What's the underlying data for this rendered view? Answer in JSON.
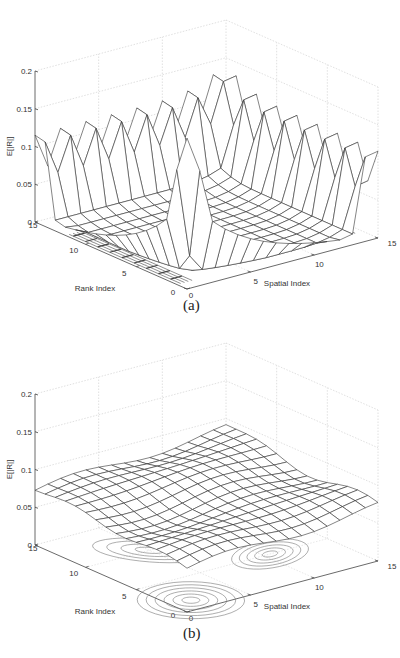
{
  "figure": {
    "panels": [
      {
        "id": "a",
        "caption": "(a)"
      },
      {
        "id": "b",
        "caption": "(b)"
      }
    ]
  },
  "chart_data": [
    {
      "type": "surface3d",
      "title": "",
      "caption": "(a)",
      "xlabel": "Spatial Index",
      "ylabel": "Rank Index",
      "zlabel": "E[|R|]",
      "xticks": [
        "0",
        "5",
        "10",
        "15"
      ],
      "yticks": [
        "0",
        "5",
        "10",
        "15"
      ],
      "zticks": [
        "0",
        "0.05",
        "0.1",
        "0.15",
        "0.2"
      ],
      "xlim": [
        0,
        15
      ],
      "ylim": [
        0,
        15
      ],
      "zlim": [
        0,
        0.2
      ],
      "grid": true,
      "contour_on_floor": true,
      "description": "Surface near 0 in the interior, rising along the outer edges (rank=15 edge and spatial=15 edge) with sawtooth peaks ~0.1; sharp ridge along spatial=0/rank=0 corner with peak ~0.2 near origin",
      "edge_peak_value": 0.1,
      "max_peak_value": 0.2,
      "interior_value": 0.005
    },
    {
      "type": "surface3d",
      "title": "",
      "caption": "(b)",
      "xlabel": "Spatial Index",
      "ylabel": "Rank Index",
      "zlabel": "E[|R|]",
      "xticks": [
        "0",
        "5",
        "10",
        "15"
      ],
      "yticks": [
        "0",
        "5",
        "10",
        "15"
      ],
      "zticks": [
        "0",
        "0.05",
        "0.1",
        "0.15",
        "0.2"
      ],
      "xlim": [
        0,
        15
      ],
      "ylim": [
        0,
        15
      ],
      "zlim": [
        0,
        0.2
      ],
      "grid": true,
      "contour_on_floor": true,
      "description": "Smooth, nearly flat surface around 0.06-0.09, gently higher toward the back corner (~0.09) and lower toward the front (~0.055)",
      "min_value": 0.05,
      "max_value": 0.095
    }
  ]
}
